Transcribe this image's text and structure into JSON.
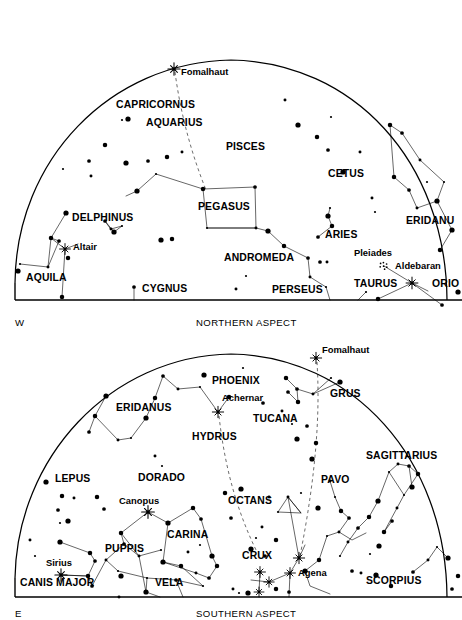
{
  "page": {
    "background": "#ffffff",
    "ink": "#000000",
    "width": 462,
    "height": 620
  },
  "charts": [
    {
      "id": "northern",
      "caption": "NORTHERN ASPECT",
      "direction_label": "W",
      "dome": {
        "cx": 231,
        "cy": 300,
        "rx": 216,
        "ry": 238,
        "baseline_y": 300
      },
      "constellation_labels": [
        {
          "name": "CAPRICORNUS",
          "x": 116,
          "y": 108
        },
        {
          "name": "AQUARIUS",
          "x": 146,
          "y": 126
        },
        {
          "name": "PISCES",
          "x": 226,
          "y": 150
        },
        {
          "name": "CETUS",
          "x": 328,
          "y": 177
        },
        {
          "name": "PEGASUS",
          "x": 198,
          "y": 210
        },
        {
          "name": "DELPHINUS",
          "x": 72,
          "y": 221
        },
        {
          "name": "ERIDANU",
          "x": 406,
          "y": 224
        },
        {
          "name": "ARIES",
          "x": 325,
          "y": 238
        },
        {
          "name": "ANDROMEDA",
          "x": 224,
          "y": 261
        },
        {
          "name": "AQUILA",
          "x": 26,
          "y": 281
        },
        {
          "name": "TAURUS",
          "x": 354,
          "y": 287
        },
        {
          "name": "ORIO",
          "x": 432,
          "y": 287
        },
        {
          "name": "CYGNUS",
          "x": 142,
          "y": 292
        },
        {
          "name": "PERSEUS",
          "x": 272,
          "y": 293
        }
      ],
      "star_labels": [
        {
          "name": "Fomalhaut",
          "x": 181,
          "y": 75
        },
        {
          "name": "Altair",
          "x": 73,
          "y": 250
        },
        {
          "name": "Pleiades",
          "x": 354,
          "y": 256
        },
        {
          "name": "Aldebaran",
          "x": 395,
          "y": 269
        }
      ],
      "bright_stars": [
        {
          "name": "Fomalhaut",
          "x": 174,
          "y": 69,
          "size": 5.2
        },
        {
          "name": "Altair",
          "x": 65,
          "y": 249,
          "size": 4.6
        },
        {
          "name": "Aldebaran",
          "x": 412,
          "y": 283,
          "size": 5.0
        }
      ],
      "pleiades_cluster": {
        "x": 384,
        "y": 266,
        "dots": 7
      }
    },
    {
      "id": "southern",
      "caption": "SOUTHERN ASPECT",
      "direction_label": "E",
      "dome": {
        "cx": 231,
        "cy": 261,
        "rx": 216,
        "ry": 240,
        "baseline_y": 261
      },
      "constellation_labels": [
        {
          "name": "PHOENIX",
          "x": 212,
          "y": 384
        },
        {
          "name": "GRUS",
          "x": 330,
          "y": 397
        },
        {
          "name": "ERIDANUS",
          "x": 116,
          "y": 411
        },
        {
          "name": "TUCANA",
          "x": 253,
          "y": 422
        },
        {
          "name": "HYDRUS",
          "x": 192,
          "y": 440
        },
        {
          "name": "SAGITTARIUS",
          "x": 366,
          "y": 459
        },
        {
          "name": "LEPUS",
          "x": 55,
          "y": 482
        },
        {
          "name": "DORADO",
          "x": 138,
          "y": 481
        },
        {
          "name": "PAVO",
          "x": 321,
          "y": 483
        },
        {
          "name": "OCTANS",
          "x": 228,
          "y": 504
        },
        {
          "name": "CARINA",
          "x": 167,
          "y": 538
        },
        {
          "name": "PUPPIS",
          "x": 105,
          "y": 552
        },
        {
          "name": "CRUX",
          "x": 242,
          "y": 559
        },
        {
          "name": "CANIS MAJOR",
          "x": 20,
          "y": 586
        },
        {
          "name": "VELA",
          "x": 155,
          "y": 586
        },
        {
          "name": "SCORPIUS",
          "x": 366,
          "y": 584
        }
      ],
      "star_labels": [
        {
          "name": "Fomalhaut",
          "x": 322,
          "y": 353
        },
        {
          "name": "Achernar",
          "x": 222,
          "y": 401
        },
        {
          "name": "Canopus",
          "x": 119,
          "y": 504
        },
        {
          "name": "Sirius",
          "x": 46,
          "y": 566
        },
        {
          "name": "Agena",
          "x": 298,
          "y": 576
        }
      ],
      "bright_stars": [
        {
          "name": "Fomalhaut",
          "x": 316,
          "y": 358,
          "size": 4.8
        },
        {
          "name": "Achernar",
          "x": 218,
          "y": 412,
          "size": 4.8
        },
        {
          "name": "Canopus",
          "x": 148,
          "y": 512,
          "size": 5.4
        },
        {
          "name": "Sirius",
          "x": 61,
          "y": 575,
          "size": 5.2
        },
        {
          "name": "Agena",
          "x": 290,
          "y": 573,
          "size": 4.6
        },
        {
          "name": "Rigil Kent",
          "x": 299,
          "y": 558,
          "size": 4.8
        },
        {
          "name": "Acrux",
          "x": 260,
          "y": 572,
          "size": 4.6
        },
        {
          "name": "Mimosa",
          "x": 269,
          "y": 582,
          "size": 4.4
        },
        {
          "name": "Gacrux",
          "x": 259,
          "y": 592,
          "size": 4.2
        }
      ]
    }
  ],
  "stars_northern": [
    [
      122,
      120
    ],
    [
      128,
      119
    ],
    [
      105,
      145
    ],
    [
      89,
      161
    ],
    [
      91,
      176
    ],
    [
      63,
      169
    ],
    [
      126,
      163
    ],
    [
      167,
      157
    ],
    [
      148,
      161
    ],
    [
      182,
      152
    ],
    [
      156,
      174
    ],
    [
      137,
      191
    ],
    [
      203,
      189
    ],
    [
      255,
      187
    ],
    [
      256,
      228
    ],
    [
      207,
      228
    ],
    [
      268,
      231
    ],
    [
      284,
      246
    ],
    [
      308,
      258
    ],
    [
      310,
      277
    ],
    [
      326,
      287
    ],
    [
      66,
      213
    ],
    [
      51,
      238
    ],
    [
      59,
      241
    ],
    [
      48,
      267
    ],
    [
      20,
      264
    ],
    [
      18,
      271
    ],
    [
      62,
      297
    ],
    [
      105,
      221
    ],
    [
      111,
      229
    ],
    [
      122,
      226
    ],
    [
      114,
      232
    ],
    [
      68,
      258
    ],
    [
      134,
      287
    ],
    [
      285,
      100
    ],
    [
      331,
      117
    ],
    [
      298,
      125
    ],
    [
      317,
      137
    ],
    [
      328,
      150
    ],
    [
      360,
      152
    ],
    [
      330,
      208
    ],
    [
      328,
      216
    ],
    [
      332,
      226
    ],
    [
      318,
      237
    ],
    [
      372,
      198
    ],
    [
      375,
      212
    ],
    [
      343,
      172
    ],
    [
      390,
      125
    ],
    [
      402,
      133
    ],
    [
      420,
      160
    ],
    [
      427,
      182
    ],
    [
      437,
      201
    ],
    [
      394,
      177
    ],
    [
      409,
      190
    ],
    [
      417,
      208
    ],
    [
      444,
      182
    ],
    [
      452,
      230
    ],
    [
      440,
      250
    ],
    [
      320,
      262
    ],
    [
      327,
      262
    ],
    [
      366,
      292
    ],
    [
      458,
      292
    ],
    [
      378,
      299
    ],
    [
      442,
      305
    ],
    [
      236,
      289
    ],
    [
      246,
      276
    ],
    [
      161,
      240
    ],
    [
      172,
      239
    ]
  ],
  "stars_southern": [
    [
      243,
      368
    ],
    [
      204,
      375
    ],
    [
      229,
      397
    ],
    [
      263,
      403
    ],
    [
      282,
      411
    ],
    [
      292,
      424
    ],
    [
      297,
      439
    ],
    [
      155,
      398
    ],
    [
      163,
      376
    ],
    [
      178,
      389
    ],
    [
      200,
      387
    ],
    [
      106,
      396
    ],
    [
      95,
      416
    ],
    [
      89,
      432
    ],
    [
      118,
      440
    ],
    [
      131,
      438
    ],
    [
      146,
      418
    ],
    [
      286,
      378
    ],
    [
      297,
      389
    ],
    [
      313,
      394
    ],
    [
      331,
      378
    ],
    [
      340,
      382
    ],
    [
      298,
      402
    ],
    [
      288,
      392
    ],
    [
      155,
      456
    ],
    [
      162,
      466
    ],
    [
      46,
      482
    ],
    [
      62,
      496
    ],
    [
      58,
      510
    ],
    [
      74,
      498
    ],
    [
      60,
      523
    ],
    [
      68,
      521
    ],
    [
      97,
      497
    ],
    [
      104,
      509
    ],
    [
      30,
      540
    ],
    [
      35,
      556
    ],
    [
      60,
      542
    ],
    [
      90,
      553
    ],
    [
      95,
      561
    ],
    [
      106,
      560
    ],
    [
      118,
      571
    ],
    [
      121,
      576
    ],
    [
      88,
      576
    ],
    [
      92,
      586
    ],
    [
      119,
      597
    ],
    [
      147,
      578
    ],
    [
      146,
      592
    ],
    [
      121,
      533
    ],
    [
      124,
      544
    ],
    [
      139,
      556
    ],
    [
      161,
      550
    ],
    [
      163,
      562
    ],
    [
      181,
      566
    ],
    [
      176,
      580
    ],
    [
      196,
      573
    ],
    [
      203,
      586
    ],
    [
      212,
      556
    ],
    [
      217,
      566
    ],
    [
      209,
      578
    ],
    [
      188,
      552
    ],
    [
      200,
      545
    ],
    [
      168,
      523
    ],
    [
      193,
      508
    ],
    [
      201,
      519
    ],
    [
      262,
      527
    ],
    [
      256,
      538
    ],
    [
      251,
      549
    ],
    [
      276,
      540
    ],
    [
      265,
      556
    ],
    [
      288,
      497
    ],
    [
      301,
      493
    ],
    [
      312,
      459
    ],
    [
      316,
      443
    ],
    [
      307,
      426
    ],
    [
      330,
      481
    ],
    [
      335,
      497
    ],
    [
      318,
      508
    ],
    [
      341,
      511
    ],
    [
      349,
      518
    ],
    [
      339,
      532
    ],
    [
      327,
      536
    ],
    [
      305,
      571
    ],
    [
      319,
      560
    ],
    [
      352,
      571
    ],
    [
      361,
      573
    ],
    [
      370,
      554
    ],
    [
      379,
      546
    ],
    [
      384,
      532
    ],
    [
      392,
      521
    ],
    [
      397,
      508
    ],
    [
      404,
      495
    ],
    [
      412,
      487
    ],
    [
      418,
      474
    ],
    [
      409,
      466
    ],
    [
      398,
      464
    ],
    [
      389,
      472
    ],
    [
      378,
      501
    ],
    [
      369,
      517
    ],
    [
      358,
      528
    ],
    [
      348,
      542
    ],
    [
      340,
      556
    ],
    [
      376,
      575
    ],
    [
      391,
      586
    ],
    [
      413,
      572
    ],
    [
      428,
      560
    ],
    [
      437,
      547
    ],
    [
      448,
      558
    ],
    [
      458,
      576
    ],
    [
      452,
      589
    ],
    [
      233,
      589
    ],
    [
      239,
      593
    ],
    [
      248,
      593
    ],
    [
      276,
      589
    ],
    [
      289,
      592
    ],
    [
      269,
      497
    ],
    [
      278,
      512
    ],
    [
      241,
      489
    ],
    [
      225,
      493
    ],
    [
      231,
      518
    ]
  ],
  "labels": {
    "northern_caption": "NORTHERN ASPECT",
    "southern_caption": "SOUTHERN ASPECT",
    "west": "W",
    "east": "E"
  }
}
